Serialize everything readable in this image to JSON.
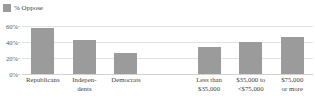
{
  "legend": {
    "entries": [
      {
        "label": "% Oppose",
        "color": "#9b9b9b",
        "swatch_name": "legend-swatch-oppose"
      }
    ],
    "position": "top-left"
  },
  "axis": {
    "y_ticks": [
      "0%",
      "20%",
      "40%",
      "60%"
    ],
    "y_min": 0,
    "y_max": 60,
    "grid": true
  },
  "colors": {
    "bar": "#9b9b9b",
    "gridline": "#e2e2e2",
    "baseline": "#d2d2d2",
    "text": "#3f3f3f",
    "background": "#ffffff"
  },
  "chart_data": {
    "type": "bar",
    "title": "",
    "subtitle": "",
    "xlabel": "",
    "ylabel": "",
    "ylim": [
      0,
      60
    ],
    "grid": true,
    "legend_position": "top-left",
    "series": [
      {
        "name": "% Oppose",
        "color": "#9b9b9b",
        "values": [
          58,
          42,
          26,
          null,
          34,
          40,
          46
        ]
      }
    ],
    "categories": [
      "Republicans",
      "Independents",
      "Democrats",
      "",
      "Less than $35,000",
      "$35,000 to <$75,000",
      "$75,000 or more"
    ],
    "category_label_lines": [
      [
        "Republicans"
      ],
      [
        "Indepen-",
        "dents"
      ],
      [
        "Democrats"
      ],
      [
        ""
      ],
      [
        "Less than",
        "$35,000"
      ],
      [
        "$35,000 to",
        "<$75,000"
      ],
      [
        "$75,000",
        "or more"
      ]
    ],
    "groups": [
      {
        "name": "Party",
        "category_indices": [
          0,
          1,
          2
        ]
      },
      {
        "name": "Household income",
        "category_indices": [
          4,
          5,
          6
        ]
      }
    ],
    "ytick_values": [
      0,
      20,
      40,
      60
    ],
    "ytick_labels": [
      "0%",
      "20%",
      "40%",
      "60%"
    ]
  },
  "bars": [
    {
      "label": "Republicans",
      "label_line1": "Republicans",
      "label_line2": "",
      "value": 58,
      "empty": false
    },
    {
      "label": "Independents",
      "label_line1": "Indepen-",
      "label_line2": "dents",
      "value": 42,
      "empty": false
    },
    {
      "label": "Democrats",
      "label_line1": "Democrats",
      "label_line2": "",
      "value": 26,
      "empty": false
    },
    {
      "label": "",
      "label_line1": "",
      "label_line2": "",
      "value": 0,
      "empty": true
    },
    {
      "label": "Less than $35,000",
      "label_line1": "Less than",
      "label_line2": "$35,000",
      "value": 34,
      "empty": false
    },
    {
      "label": "$35,000 to <$75,000",
      "label_line1": "$35,000 to",
      "label_line2": "<$75,000",
      "value": 40,
      "empty": false
    },
    {
      "label": "$75,000 or more",
      "label_line1": "$75,000",
      "label_line2": "or more",
      "value": 46,
      "empty": false
    }
  ]
}
